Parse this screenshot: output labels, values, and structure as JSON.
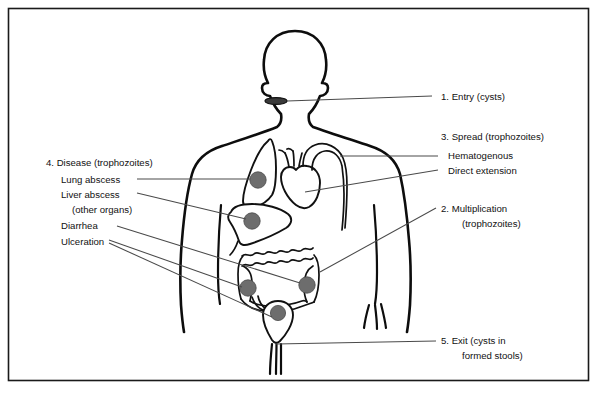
{
  "figure": {
    "frame_color": "#1a1a1a",
    "background": "#ffffff",
    "dot_color": "#6d6d6d",
    "line_color": "#111111",
    "leader_color": "#4a4a4a"
  },
  "labels": {
    "entry": {
      "number": "1.",
      "line1": "1. Entry (cysts)"
    },
    "spread": {
      "line1": "3. Spread (trophozoites)",
      "line2": "Hematogenous",
      "line3": "Direct extension"
    },
    "multiplication": {
      "line1": "2. Multiplication",
      "line2": "(trophozoites)"
    },
    "exit": {
      "line1": "5. Exit (cysts in",
      "line2": "formed stools)"
    },
    "disease": {
      "line1": "4. Disease (trophozoites)",
      "line2": "Lung abscess",
      "line3": "Liver abscess",
      "line4": "(other organs)",
      "line5": "Diarrhea",
      "line6": "Ulceration"
    }
  },
  "anatomy": {
    "mouth": "mouth-entry-site",
    "lung": "lung",
    "liver": "liver",
    "heart": "heart",
    "aorta": "aortic-arch",
    "colon": "large-intestine",
    "appendix": "appendix",
    "rectum": "rectum",
    "sites": [
      {
        "name": "lung-abscess-site",
        "cx": 258,
        "cy": 180
      },
      {
        "name": "liver-abscess-site",
        "cx": 252,
        "cy": 221
      },
      {
        "name": "colon-ulceration-site-left",
        "cx": 248,
        "cy": 288
      },
      {
        "name": "colon-diarrhea-site-right",
        "cx": 307,
        "cy": 285
      },
      {
        "name": "rectum-exit-site",
        "cx": 278,
        "cy": 313
      }
    ]
  }
}
